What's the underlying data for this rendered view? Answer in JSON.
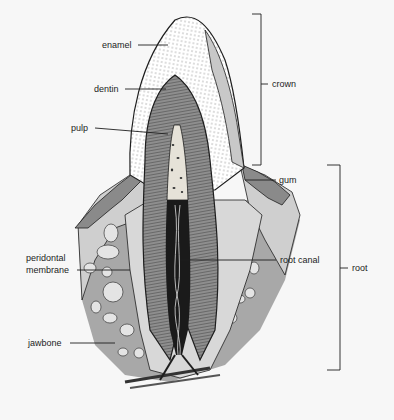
{
  "figure": {
    "labels": {
      "enamel": "enamel",
      "dentin": "dentin",
      "pulp": "pulp",
      "crown": "crown",
      "gum": "gum",
      "peridontal_line1": "peridontal",
      "peridontal_line2": "membrane",
      "root_canal": "root canal",
      "root": "root",
      "jawbone": "jawbone"
    },
    "colors": {
      "background": "#f7f7f7",
      "enamel": "#ffffff",
      "dentin": "#8e8e8e",
      "pulp": "#e6e2d8",
      "canal": "#1a1a1a",
      "gum": "#9a9a9a",
      "gum_outer": "#cfcfcf",
      "jawbone": "#a8a8a8",
      "bone_cavity": "#e4e4e4",
      "outline": "#1e1e1e"
    }
  }
}
